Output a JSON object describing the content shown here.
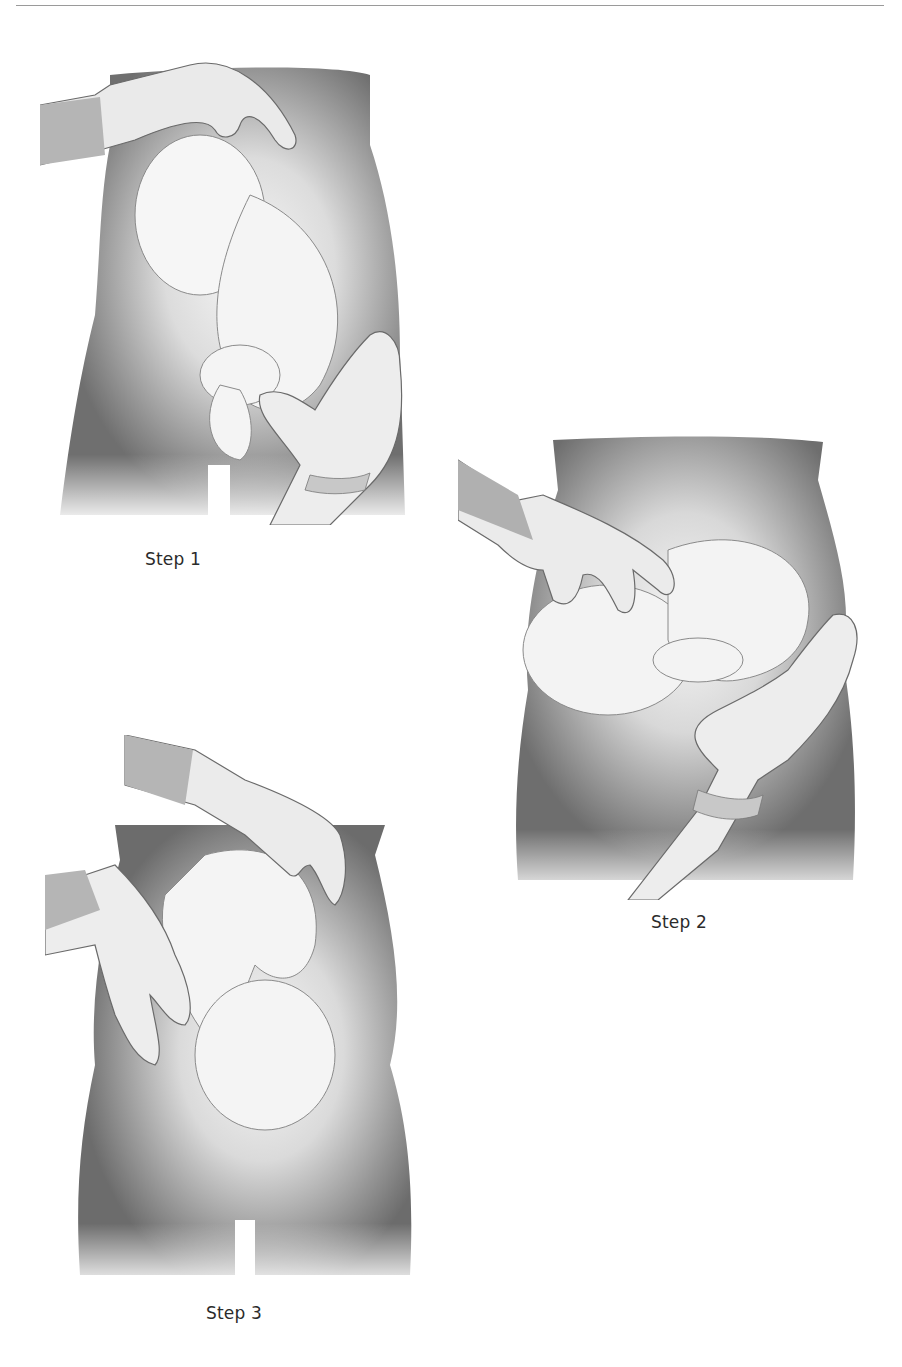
{
  "page": {
    "type": "illustration-page",
    "background": "#ffffff",
    "rule_color": "#9a9a9a"
  },
  "figures": [
    {
      "caption": "Step 1",
      "subject": "torso-with-fetus-and-gloved-hands"
    },
    {
      "caption": "Step 2",
      "subject": "torso-with-fetus-and-gloved-hands"
    },
    {
      "caption": "Step 3",
      "subject": "torso-with-fetus-and-gloved-hands"
    }
  ],
  "colors": {
    "skin_dark": "#6e6e6e",
    "skin_mid": "#9a9a9a",
    "highlight": "#f2f2f2",
    "glove": "#ededed",
    "outline": "#555555"
  }
}
